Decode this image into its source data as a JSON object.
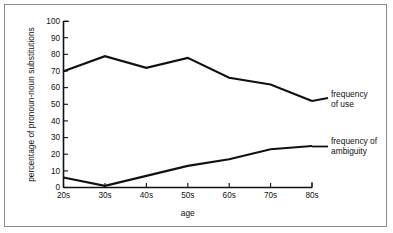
{
  "chart_data": {
    "type": "line",
    "title": "",
    "xlabel": "age",
    "ylabel": "percentage of pronoun-noun substitutions",
    "categories": [
      "20s",
      "30s",
      "40s",
      "50s",
      "60s",
      "70s",
      "80s"
    ],
    "ylim": [
      0,
      100
    ],
    "yticks": [
      0,
      10,
      20,
      30,
      40,
      50,
      60,
      70,
      80,
      90,
      100
    ],
    "ytick_labels": [
      "0",
      "10",
      "20",
      "30",
      "40",
      "50",
      "60",
      "70",
      "80",
      "90",
      "100"
    ],
    "grid": false,
    "legend_position": "right-inline-labels",
    "series": [
      {
        "name": "frequency of use",
        "label_line1": "frequency",
        "label_line2": "of use",
        "values": [
          70,
          79,
          72,
          78,
          66,
          62,
          52
        ],
        "color": "#111111"
      },
      {
        "name": "frequency of ambiguity",
        "label_line1": "frequency of",
        "label_line2": "ambiguity",
        "values": [
          6,
          1,
          7,
          13,
          17,
          23,
          25
        ],
        "color": "#111111"
      }
    ]
  },
  "frame": {
    "border_color": "#8a8a8a",
    "background": "#ffffff"
  }
}
